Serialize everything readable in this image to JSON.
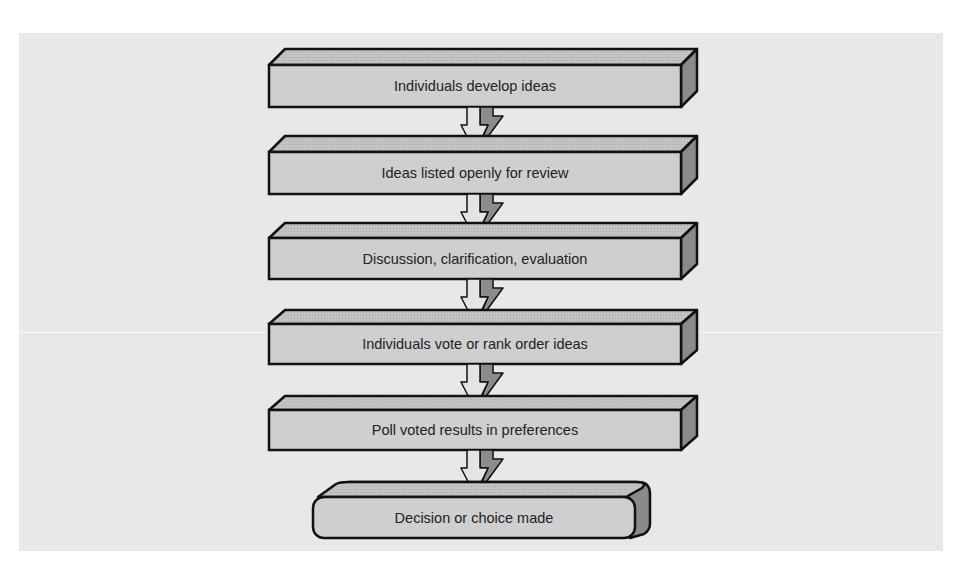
{
  "diagram": {
    "type": "flowchart",
    "direction": "top-to-bottom",
    "colors": {
      "background": "#e8e8e8",
      "box_front": "#cfcfcf",
      "box_top": "#bdbdbd",
      "box_side": "#8a8a8a",
      "outline": "#111111",
      "arrow_light": "#e4e4e4",
      "arrow_dark": "#8c8c8c"
    },
    "steps": [
      {
        "label": "Individuals develop ideas",
        "shape": "3d-box"
      },
      {
        "label": "Ideas listed openly for review",
        "shape": "3d-box"
      },
      {
        "label": "Discussion, clarification, evaluation",
        "shape": "3d-box"
      },
      {
        "label": "Individuals vote or rank order ideas",
        "shape": "3d-box"
      },
      {
        "label": "Poll voted results in preferences",
        "shape": "3d-box"
      },
      {
        "label": "Decision or choice made",
        "shape": "3d-rounded-box"
      }
    ],
    "arrows": [
      {
        "from": 0,
        "to": 1,
        "icon": "down-arrow-icon"
      },
      {
        "from": 1,
        "to": 2,
        "icon": "down-arrow-icon"
      },
      {
        "from": 2,
        "to": 3,
        "icon": "down-arrow-icon"
      },
      {
        "from": 3,
        "to": 4,
        "icon": "down-arrow-icon"
      },
      {
        "from": 4,
        "to": 5,
        "icon": "down-arrow-icon"
      }
    ]
  }
}
